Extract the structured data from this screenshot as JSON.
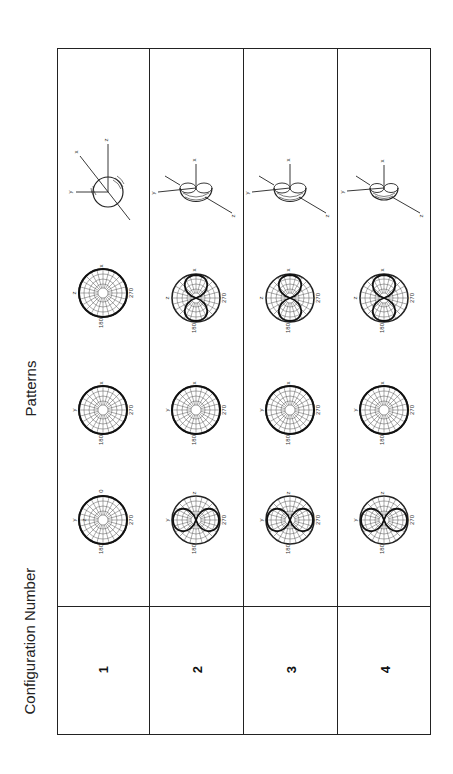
{
  "figure": {
    "orientation": "rotated 90 degrees counter-clockwise",
    "column_headers": {
      "patterns": "Patterns",
      "configuration_number": "Configuration Number"
    },
    "configurations": [
      {
        "number": "1",
        "plots": [
          {
            "plane": "y-z",
            "top_label": "z",
            "left_label": "y",
            "angle_labels": [
              "0",
              "90",
              "180",
              "270"
            ],
            "pattern": "omnidirectional circle"
          },
          {
            "plane": "x-y",
            "top_label": "x",
            "left_label": "y",
            "angle_labels": [
              "0",
              "90",
              "180",
              "270"
            ],
            "pattern": "omnidirectional circle"
          },
          {
            "plane": "x-z",
            "top_label": "x",
            "left_label": "z",
            "angle_labels": [
              "0",
              "90",
              "180",
              "270"
            ],
            "pattern": "omnidirectional circle"
          }
        ],
        "three_d": {
          "axes": [
            "x",
            "y",
            "z"
          ],
          "shape": "sphere"
        }
      },
      {
        "number": "2",
        "plots": [
          {
            "plane": "y-z",
            "top_label": "z",
            "left_label": "y",
            "angle_labels": [
              "0",
              "90",
              "180",
              "270"
            ],
            "pattern": "figure-eight (two lobes)"
          },
          {
            "plane": "x-y",
            "top_label": "x",
            "left_label": "y",
            "angle_labels": [
              "0",
              "90",
              "180",
              "270"
            ],
            "pattern": "omnidirectional circle"
          },
          {
            "plane": "x-z",
            "top_label": "x",
            "left_label": "z",
            "angle_labels": [
              "0",
              "90",
              "180",
              "270"
            ],
            "pattern": "figure-eight (two lobes)"
          }
        ],
        "three_d": {
          "axes": [
            "x",
            "y",
            "z"
          ],
          "shape": "toroid (donut)"
        }
      },
      {
        "number": "3",
        "plots": [
          {
            "plane": "y-z",
            "top_label": "z",
            "left_label": "y",
            "angle_labels": [
              "0",
              "90",
              "180",
              "270"
            ],
            "pattern": "figure-eight (two lobes)"
          },
          {
            "plane": "x-y",
            "top_label": "x",
            "left_label": "y",
            "angle_labels": [
              "0",
              "90",
              "180",
              "270"
            ],
            "pattern": "omnidirectional circle"
          },
          {
            "plane": "x-z",
            "top_label": "x",
            "left_label": "z",
            "angle_labels": [
              "0",
              "90",
              "180",
              "270"
            ],
            "pattern": "figure-eight (two lobes)"
          }
        ],
        "three_d": {
          "axes": [
            "x",
            "y",
            "z"
          ],
          "shape": "toroid (donut)"
        }
      },
      {
        "number": "4",
        "plots": [
          {
            "plane": "y-z",
            "top_label": "z",
            "left_label": "y",
            "angle_labels": [
              "0",
              "90",
              "180",
              "270"
            ],
            "pattern": "figure-eight (two lobes)"
          },
          {
            "plane": "x-y",
            "top_label": "x",
            "left_label": "y",
            "angle_labels": [
              "0",
              "90",
              "180",
              "270"
            ],
            "pattern": "omnidirectional circle"
          },
          {
            "plane": "x-z",
            "top_label": "x",
            "left_label": "z",
            "angle_labels": [
              "0",
              "90",
              "180",
              "270"
            ],
            "pattern": "figure-eight (two lobes)"
          }
        ],
        "three_d": {
          "axes": [
            "x",
            "y",
            "z"
          ],
          "shape": "toroid (donut)"
        }
      }
    ]
  },
  "colors": {
    "line": "#222222",
    "grid": "#555555",
    "background": "#ffffff"
  }
}
